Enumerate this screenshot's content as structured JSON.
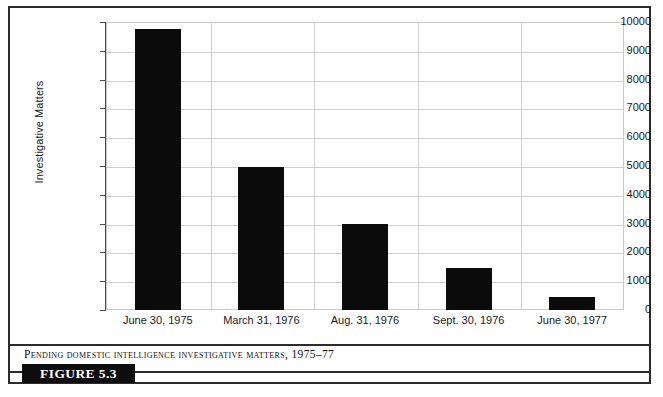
{
  "figure": {
    "badge_label": "FIGURE 5.3",
    "caption": "Pending Domestic Intelligence Investigative Matters, 1975–77"
  },
  "chart_data": {
    "type": "bar",
    "title": "",
    "xlabel": "",
    "ylabel": "Investigative Matters",
    "categories": [
      "June 30, 1975",
      "March 31, 1976",
      "Aug. 31, 1976",
      "Sept. 30, 1976",
      "June 30, 1977"
    ],
    "values": [
      9750,
      4980,
      2980,
      1450,
      450
    ],
    "ylim": [
      0,
      10000
    ],
    "yticks": [
      0,
      1000,
      2000,
      3000,
      4000,
      5000,
      6000,
      7000,
      8000,
      9000,
      10000
    ],
    "ytick_labels": [
      "0",
      "1000",
      "2000",
      "3000",
      "4000",
      "5000",
      "6000",
      "7000",
      "8000",
      "9000",
      "10000"
    ],
    "grid": true,
    "grid_axis": "both",
    "legend": false,
    "bar_color": "#0b0b0b",
    "grid_color": "#cfcfcf",
    "axis_color": "#4a4a4a"
  }
}
